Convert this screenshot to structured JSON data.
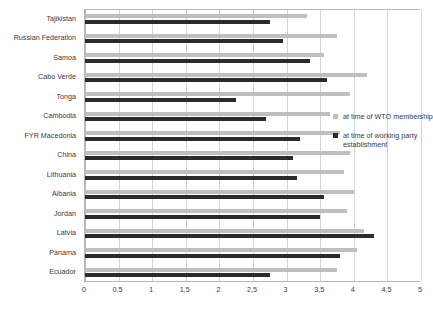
{
  "chart_data": {
    "type": "bar",
    "orientation": "horizontal",
    "title": "",
    "subtitle": "",
    "xlabel": "",
    "ylabel": "",
    "xlim": [
      0,
      5
    ],
    "ylim": null,
    "grid": true,
    "legend_position": "right",
    "decimal_separator": ",",
    "xticks": [
      "0",
      "0,5",
      "1",
      "1,5",
      "2",
      "2,5",
      "3",
      "3,5",
      "4",
      "4,5",
      "5"
    ],
    "xtick_values": [
      0,
      0.5,
      1,
      1.5,
      2,
      2.5,
      3,
      3.5,
      4,
      4.5,
      5
    ],
    "categories": [
      "Tajikistan",
      "Russian Federation",
      "Samoa",
      "Cabo Verde",
      "Tonga",
      "Cambodia",
      "FYR Macedonia",
      "China",
      "Lithuania",
      "Albania",
      "Jordan",
      "Latvia",
      "Panama",
      "Ecuador"
    ],
    "series": [
      {
        "name": "at time of WTO membership",
        "color": "#bfbfbf",
        "values": [
          3.3,
          3.75,
          3.55,
          4.2,
          3.95,
          3.65,
          3.8,
          3.95,
          3.85,
          4.0,
          3.9,
          4.15,
          4.05,
          3.75
        ]
      },
      {
        "name": "at time of working party establishment",
        "color": "#2b2b2b",
        "values": [
          2.75,
          2.95,
          3.35,
          3.6,
          2.25,
          2.7,
          3.2,
          3.1,
          3.15,
          3.55,
          3.5,
          4.3,
          3.8,
          2.75
        ]
      }
    ]
  },
  "legend": {
    "entries": [
      {
        "label": "at time of WTO membership"
      },
      {
        "label": "at time of working party establishment"
      }
    ]
  }
}
